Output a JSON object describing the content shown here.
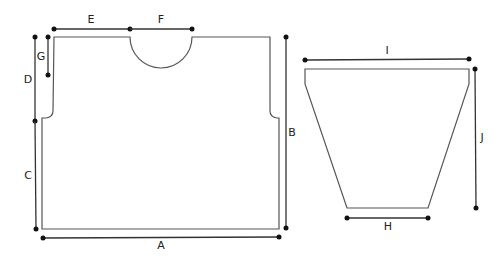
{
  "diagram": {
    "pieces": [
      {
        "name": "body",
        "label": "Front/back body panel"
      },
      {
        "name": "sleeve",
        "label": "Sleeve"
      }
    ],
    "dimensions": {
      "A": "A",
      "B": "B",
      "C": "C",
      "D": "D",
      "E": "E",
      "F": "F",
      "G": "G",
      "H": "H",
      "I": "I",
      "J": "J"
    },
    "colors": {
      "outline": "#555555",
      "dimension_line": "#333333",
      "background": "#ffffff"
    }
  }
}
